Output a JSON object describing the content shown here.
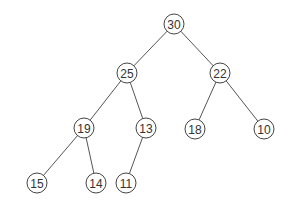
{
  "diagram": {
    "type": "binary-tree",
    "node_radius": 10,
    "colors": {
      "edge": "#555555",
      "node_stroke": "#444444",
      "node_fill": "#ffffff",
      "text": "#333333"
    },
    "nodes": [
      {
        "id": "n30",
        "label": "30",
        "x": 174,
        "y": 24
      },
      {
        "id": "n25",
        "label": "25",
        "x": 127,
        "y": 73
      },
      {
        "id": "n22",
        "label": "22",
        "x": 220,
        "y": 73
      },
      {
        "id": "n19",
        "label": "19",
        "x": 84,
        "y": 128
      },
      {
        "id": "n13",
        "label": "13",
        "x": 146,
        "y": 128
      },
      {
        "id": "n18",
        "label": "18",
        "x": 195,
        "y": 129
      },
      {
        "id": "n10",
        "label": "10",
        "x": 264,
        "y": 129
      },
      {
        "id": "n15",
        "label": "15",
        "x": 37,
        "y": 183
      },
      {
        "id": "n14",
        "label": "14",
        "x": 96,
        "y": 183
      },
      {
        "id": "n11",
        "label": "11",
        "x": 126,
        "y": 183
      }
    ],
    "edges": [
      [
        "n30",
        "n25"
      ],
      [
        "n30",
        "n22"
      ],
      [
        "n25",
        "n19"
      ],
      [
        "n25",
        "n13"
      ],
      [
        "n22",
        "n18"
      ],
      [
        "n22",
        "n10"
      ],
      [
        "n19",
        "n15"
      ],
      [
        "n19",
        "n14"
      ],
      [
        "n13",
        "n11"
      ]
    ]
  }
}
